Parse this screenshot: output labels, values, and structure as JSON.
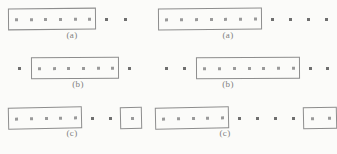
{
  "figure": {
    "background_color": "#fbfbf9",
    "ink_color": "#8d8d8d",
    "dot_color": "#9a9a9a",
    "columns": 2,
    "rows": 3
  },
  "panels": [
    {
      "id": "left-a",
      "caption": "(a)",
      "column": "left",
      "row": 1,
      "left": 8,
      "top": 8,
      "caption_left": 42,
      "caption_top": 30,
      "caption_width": 60,
      "elements": [
        {
          "kind": "box",
          "dots": 6,
          "left": 0,
          "width": 88,
          "skew": "skew-a"
        },
        {
          "kind": "dot",
          "left": 97
        },
        {
          "kind": "dot",
          "left": 116
        }
      ]
    },
    {
      "id": "right-a",
      "caption": "(a)",
      "column": "right",
      "row": 1,
      "left": 158,
      "top": 8,
      "caption_left": 198,
      "caption_top": 30,
      "caption_width": 60,
      "elements": [
        {
          "kind": "box",
          "dots": 7,
          "left": 0,
          "width": 104,
          "skew": "skew-a"
        },
        {
          "kind": "dot",
          "left": 113
        },
        {
          "kind": "dot",
          "left": 131
        },
        {
          "kind": "dot",
          "left": 149
        },
        {
          "kind": "dot",
          "left": 167
        }
      ]
    },
    {
      "id": "left-b",
      "caption": "(b)",
      "column": "left",
      "row": 2,
      "left": 16,
      "top": 57,
      "caption_left": 48,
      "caption_top": 79,
      "caption_width": 60,
      "elements": [
        {
          "kind": "dot",
          "left": 2
        },
        {
          "kind": "box",
          "dots": 6,
          "left": 15,
          "width": 88,
          "skew": "skew-b"
        },
        {
          "kind": "dot",
          "left": 112
        }
      ]
    },
    {
      "id": "right-b",
      "caption": "(b)",
      "column": "right",
      "row": 2,
      "left": 163,
      "top": 57,
      "caption_left": 198,
      "caption_top": 79,
      "caption_width": 60,
      "elements": [
        {
          "kind": "dot",
          "left": 2
        },
        {
          "kind": "dot",
          "left": 20
        },
        {
          "kind": "box",
          "dots": 7,
          "left": 33,
          "width": 104,
          "skew": "skew-b"
        },
        {
          "kind": "dot",
          "left": 146
        },
        {
          "kind": "dot",
          "left": 163
        }
      ]
    },
    {
      "id": "left-c",
      "caption": "(c)",
      "column": "left",
      "row": 3,
      "left": 8,
      "top": 107,
      "caption_left": 42,
      "caption_top": 128,
      "caption_width": 60,
      "elements": [
        {
          "kind": "box",
          "dots": 5,
          "left": 0,
          "width": 74,
          "skew": "skew-c"
        },
        {
          "kind": "dot",
          "left": 83
        },
        {
          "kind": "dot",
          "left": 101
        },
        {
          "kind": "box",
          "dots": 1,
          "left": 112,
          "width": 22,
          "skew": "skew-c"
        }
      ]
    },
    {
      "id": "right-c",
      "caption": "(c)",
      "column": "right",
      "row": 3,
      "left": 155,
      "top": 107,
      "caption_left": 195,
      "caption_top": 128,
      "caption_width": 60,
      "elements": [
        {
          "kind": "box",
          "dots": 5,
          "left": 0,
          "width": 74,
          "skew": "skew-c"
        },
        {
          "kind": "dot",
          "left": 83
        },
        {
          "kind": "dot",
          "left": 101
        },
        {
          "kind": "dot",
          "left": 119
        },
        {
          "kind": "dot",
          "left": 137
        },
        {
          "kind": "box",
          "dots": 2,
          "left": 148,
          "width": 34,
          "skew": "skew-c"
        }
      ]
    }
  ]
}
